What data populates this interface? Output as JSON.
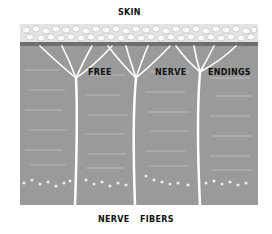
{
  "diagram": {
    "title": "SKIN",
    "labels": {
      "top": "SKIN",
      "ending_1": "FREE",
      "ending_2": "NERVE",
      "ending_3": "ENDINGS",
      "bottom_1": "NERVE",
      "bottom_2": "FIBERS"
    },
    "colors": {
      "tissue": "#9a9a9a",
      "skin_cells": "#f2f2f2",
      "nerve": "#ffffff",
      "text": "#111111"
    }
  }
}
